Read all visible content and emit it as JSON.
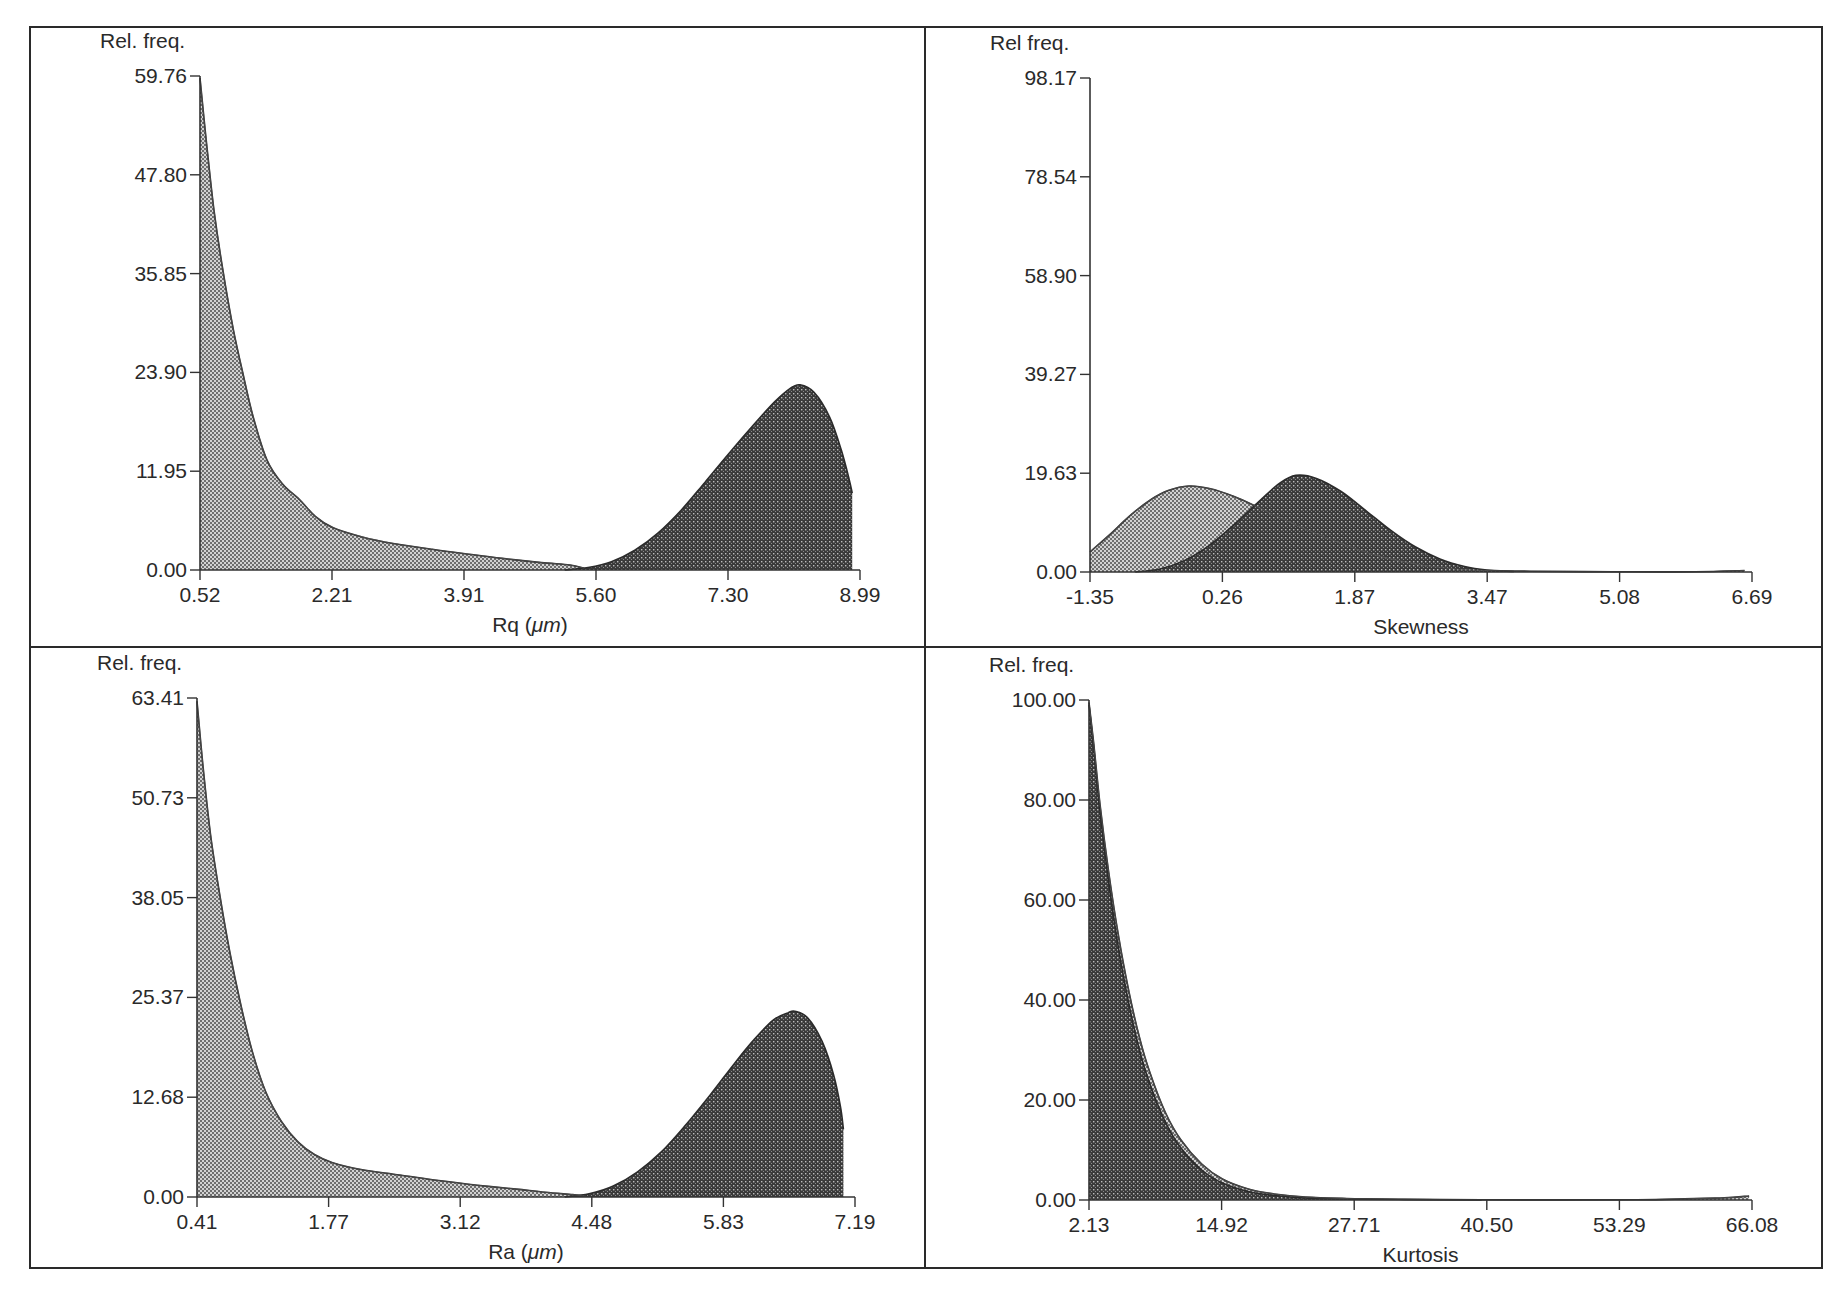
{
  "figure": {
    "panels_layout": "2x2 grid",
    "frame": {
      "left": 30,
      "top": 27,
      "right": 1822,
      "bottom": 1268,
      "col_divider_x": 925,
      "row_divider_y": 647
    }
  },
  "colors": {
    "frame": "#2a2a2a",
    "light_fill": "#9a9a9a",
    "dark_fill": "#3c3c3c",
    "text": "#2a2a2a"
  },
  "chart_data": [
    {
      "id": "rq",
      "type": "area",
      "title": "",
      "ylabel": "Rel. freq.",
      "xlabel": "Rq (μm)",
      "xlabel_prefix": "Rq (",
      "xlabel_unit": "μm",
      "xlabel_suffix": ")",
      "y_ticks": [
        "0.00",
        "11.95",
        "23.90",
        "35.85",
        "47.80",
        "59.76"
      ],
      "x_ticks": [
        "0.52",
        "2.21",
        "3.91",
        "5.60",
        "7.30",
        "8.99"
      ],
      "ylim": [
        0,
        59.76
      ],
      "xlim": [
        0.52,
        8.99
      ],
      "grid": false,
      "legend": null,
      "plot_px": {
        "x0": 200,
        "x1": 860,
        "y_top": 76,
        "y_zero": 570
      },
      "series": [
        {
          "name": "distribution A (light)",
          "shade": "light",
          "x": [
            0.52,
            0.6,
            0.7,
            0.82,
            0.95,
            1.07,
            1.2,
            1.38,
            1.58,
            1.8,
            2.0,
            2.23,
            2.6,
            3.0,
            3.5,
            3.9,
            4.4,
            4.9,
            5.27,
            5.45
          ],
          "values": [
            59.5,
            52.0,
            43.5,
            35.9,
            29.0,
            23.8,
            18.6,
            13.3,
            10.4,
            8.5,
            6.5,
            5.1,
            4.0,
            3.2,
            2.5,
            2.0,
            1.4,
            0.9,
            0.6,
            0.2
          ]
        },
        {
          "name": "distribution B (dark)",
          "shade": "dark",
          "x": [
            5.2,
            5.5,
            5.8,
            6.1,
            6.4,
            6.7,
            7.0,
            7.3,
            7.6,
            7.9,
            8.1,
            8.22,
            8.4,
            8.6,
            8.75,
            8.85,
            8.89
          ],
          "values": [
            0.0,
            0.3,
            1.0,
            2.4,
            4.5,
            7.3,
            10.6,
            14.0,
            17.3,
            20.4,
            22.0,
            22.4,
            21.5,
            18.5,
            14.5,
            11.0,
            9.3
          ]
        }
      ]
    },
    {
      "id": "skewness",
      "type": "area",
      "title": "",
      "ylabel": "Rel freq.",
      "xlabel": "Skewness",
      "xlabel_prefix": "Skewness",
      "xlabel_unit": "",
      "xlabel_suffix": "",
      "y_ticks": [
        "0.00",
        "19.63",
        "39.27",
        "58.90",
        "78.54",
        "98.17"
      ],
      "x_ticks": [
        "-1.35",
        "0.26",
        "1.87",
        "3.47",
        "5.08",
        "6.69"
      ],
      "ylim": [
        0,
        98.17
      ],
      "xlim": [
        -1.35,
        6.69
      ],
      "grid": false,
      "legend": null,
      "plot_px": {
        "x0": 1090,
        "x1": 1752,
        "y_top": 78,
        "y_zero": 572
      },
      "series": [
        {
          "name": "distribution A (light)",
          "shade": "light",
          "x": [
            -1.35,
            -1.1,
            -0.85,
            -0.6,
            -0.4,
            -0.15,
            0.1,
            0.4,
            0.7,
            1.0,
            1.3,
            1.6,
            1.9,
            2.2,
            2.5,
            2.8,
            3.1,
            3.47,
            4.0,
            5.0,
            6.0,
            6.6
          ],
          "values": [
            4.0,
            7.6,
            11.4,
            14.5,
            16.2,
            17.1,
            16.6,
            15.0,
            12.8,
            10.5,
            8.3,
            6.3,
            4.5,
            3.0,
            1.9,
            1.1,
            0.6,
            0.3,
            0.15,
            0.05,
            0.05,
            0.3
          ]
        },
        {
          "name": "distribution B (dark)",
          "shade": "dark",
          "x": [
            -0.8,
            -0.5,
            -0.2,
            0.1,
            0.4,
            0.7,
            0.95,
            1.15,
            1.4,
            1.7,
            2.0,
            2.3,
            2.6,
            2.9,
            3.2,
            3.47,
            3.8
          ],
          "values": [
            0.0,
            0.6,
            2.3,
            5.3,
            9.4,
            14.0,
            17.6,
            19.2,
            18.6,
            16.0,
            12.2,
            8.3,
            5.0,
            2.6,
            1.1,
            0.4,
            0.1
          ]
        }
      ]
    },
    {
      "id": "ra",
      "type": "area",
      "title": "",
      "ylabel": "Rel. freq.",
      "xlabel": "Ra (μm)",
      "xlabel_prefix": "Ra (",
      "xlabel_unit": "μm",
      "xlabel_suffix": ")",
      "y_ticks": [
        "0.00",
        "12.68",
        "25.37",
        "38.05",
        "50.73",
        "63.41"
      ],
      "x_ticks": [
        "0.41",
        "1.77",
        "3.12",
        "4.48",
        "5.83",
        "7.19"
      ],
      "ylim": [
        0,
        63.41
      ],
      "xlim": [
        0.41,
        7.19
      ],
      "grid": false,
      "legend": null,
      "plot_px": {
        "x0": 197,
        "x1": 855,
        "y_top": 698,
        "y_zero": 1197
      },
      "series": [
        {
          "name": "distribution A (light)",
          "shade": "light",
          "x": [
            0.41,
            0.47,
            0.55,
            0.65,
            0.75,
            0.86,
            0.98,
            1.12,
            1.28,
            1.45,
            1.62,
            1.8,
            2.1,
            2.5,
            2.9,
            3.3,
            3.7,
            4.0,
            4.28,
            4.42
          ],
          "values": [
            63.0,
            55.0,
            46.0,
            38.0,
            31.0,
            24.5,
            18.5,
            13.3,
            9.6,
            7.0,
            5.4,
            4.4,
            3.5,
            2.8,
            2.1,
            1.5,
            1.0,
            0.6,
            0.3,
            0.1
          ]
        },
        {
          "name": "distribution B (dark)",
          "shade": "dark",
          "x": [
            4.2,
            4.45,
            4.7,
            4.95,
            5.2,
            5.45,
            5.7,
            5.95,
            6.15,
            6.35,
            6.5,
            6.57,
            6.7,
            6.85,
            6.97,
            7.04,
            7.07
          ],
          "values": [
            0.0,
            0.4,
            1.4,
            3.2,
            5.8,
            9.2,
            13.0,
            17.0,
            20.0,
            22.5,
            23.4,
            23.6,
            22.8,
            19.8,
            15.5,
            11.5,
            8.6
          ]
        }
      ]
    },
    {
      "id": "kurtosis",
      "type": "area",
      "title": "",
      "ylabel": "Rel. freq.",
      "xlabel": "Kurtosis",
      "xlabel_prefix": "Kurtosis",
      "xlabel_unit": "",
      "xlabel_suffix": "",
      "y_ticks": [
        "0.00",
        "20.00",
        "40.00",
        "60.00",
        "80.00",
        "100.00"
      ],
      "x_ticks": [
        "2.13",
        "14.92",
        "27.71",
        "40.50",
        "53.29",
        "66.08"
      ],
      "ylim": [
        0,
        100
      ],
      "xlim": [
        2.13,
        66.08
      ],
      "grid": false,
      "legend": null,
      "plot_px": {
        "x0": 1089,
        "x1": 1752,
        "y_top": 700,
        "y_zero": 1200
      },
      "series": [
        {
          "name": "distribution A (light)",
          "shade": "light",
          "x": [
            2.13,
            2.6,
            3.2,
            4.0,
            5.0,
            6.0,
            7.0,
            8.0,
            9.5,
            11.0,
            13.0,
            15.0,
            17.5,
            20.0,
            23.0,
            27.0,
            32.0,
            40.0,
            55.0,
            63.0,
            65.8
          ],
          "values": [
            99.5,
            91.0,
            79.0,
            66.0,
            52.5,
            41.5,
            32.5,
            25.5,
            17.5,
            12.0,
            7.2,
            4.2,
            2.2,
            1.2,
            0.6,
            0.3,
            0.15,
            0.05,
            0.05,
            0.4,
            0.8
          ]
        },
        {
          "name": "distribution B (dark)",
          "shade": "dark",
          "x": [
            2.13,
            2.6,
            3.2,
            4.0,
            5.0,
            6.0,
            7.0,
            8.0,
            9.5,
            11.0,
            13.0,
            15.0,
            17.5,
            20.0,
            23.0,
            27.0,
            32.0,
            40.0
          ],
          "values": [
            99.0,
            90.0,
            77.5,
            64.0,
            50.0,
            39.0,
            30.0,
            23.2,
            15.6,
            10.4,
            6.0,
            3.4,
            1.7,
            0.9,
            0.4,
            0.2,
            0.1,
            0.0
          ]
        }
      ]
    }
  ]
}
